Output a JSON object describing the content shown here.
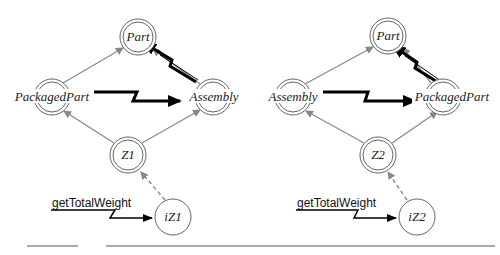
{
  "diagrams": [
    {
      "id": "left",
      "nodes": {
        "top": {
          "label": "Part",
          "type": "double"
        },
        "left": {
          "label": "PackagedPart",
          "type": "double"
        },
        "right": {
          "label": "Assembly",
          "type": "double"
        },
        "bottom": {
          "label": "Z1",
          "type": "double"
        },
        "instance": {
          "label": "iZ1",
          "type": "single"
        }
      },
      "message": {
        "label": "getTotalWeight"
      }
    },
    {
      "id": "right",
      "nodes": {
        "top": {
          "label": "Part",
          "type": "double"
        },
        "left": {
          "label": "Assembly",
          "type": "double"
        },
        "right": {
          "label": "PackagedPart",
          "type": "double"
        },
        "bottom": {
          "label": "Z2",
          "type": "double"
        },
        "instance": {
          "label": "iZ2",
          "type": "single"
        }
      },
      "message": {
        "label": "getTotalWeight"
      }
    }
  ],
  "colors": {
    "inheritance_edge": "#888888",
    "dependency_edge": "#888888",
    "bolt_arrow": "#000000",
    "node_ring": "#666666"
  }
}
